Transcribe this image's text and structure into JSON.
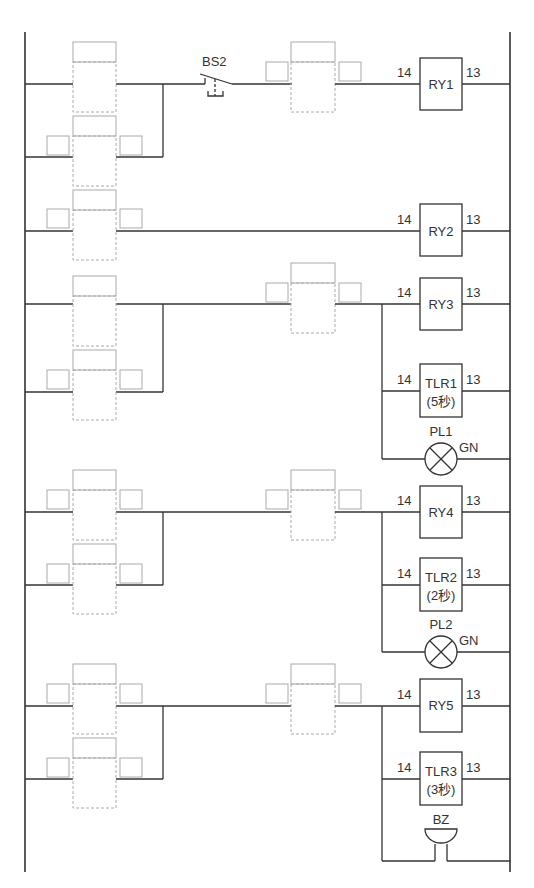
{
  "switch": {
    "label": "BS2"
  },
  "terminals": {
    "left": "14",
    "right": "13"
  },
  "coils": [
    {
      "id": "RY1",
      "label": "RY1"
    },
    {
      "id": "RY2",
      "label": "RY2"
    },
    {
      "id": "RY3",
      "label": "RY3"
    },
    {
      "id": "TLR1",
      "label": "TLR1",
      "sub": "(5秒)"
    },
    {
      "id": "RY4",
      "label": "RY4"
    },
    {
      "id": "TLR2",
      "label": "TLR2",
      "sub": "(2秒)"
    },
    {
      "id": "RY5",
      "label": "RY5"
    },
    {
      "id": "TLR3",
      "label": "TLR3",
      "sub": "(3秒)"
    }
  ],
  "lamps": [
    {
      "id": "PL1",
      "label": "PL1",
      "color": "GN"
    },
    {
      "id": "PL2",
      "label": "PL2",
      "color": "GN"
    }
  ],
  "buzzer": {
    "label": "BZ"
  }
}
